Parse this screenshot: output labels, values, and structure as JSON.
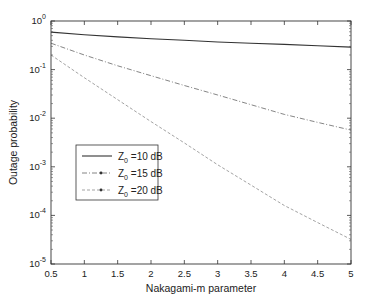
{
  "chart_data": {
    "type": "line",
    "title": "",
    "xlabel": "Nakagami-m parameter",
    "ylabel": "Outage probability",
    "xlim": [
      0.5,
      5
    ],
    "ylim_log10": [
      -5,
      0
    ],
    "yscale": "log",
    "grid": false,
    "legend_position": "left-center",
    "x_ticks": [
      "0.5",
      "1",
      "1.5",
      "2",
      "2.5",
      "3",
      "3.5",
      "4",
      "4.5",
      "5"
    ],
    "y_ticks": [
      {
        "base": "10",
        "exp": "0"
      },
      {
        "base": "10",
        "exp": "-1"
      },
      {
        "base": "10",
        "exp": "-2"
      },
      {
        "base": "10",
        "exp": "-3"
      },
      {
        "base": "10",
        "exp": "-4"
      },
      {
        "base": "10",
        "exp": "-5"
      }
    ],
    "x": [
      0.5,
      1,
      1.5,
      2,
      2.5,
      3,
      3.5,
      4,
      4.5,
      5
    ],
    "series": [
      {
        "name": "Z0 =10 dB",
        "label_main": "Z",
        "label_sub": "0",
        "label_rest": " =10 dB",
        "style": "solid",
        "color": "#333333",
        "values": [
          0.59,
          0.52,
          0.47,
          0.43,
          0.4,
          0.37,
          0.35,
          0.33,
          0.31,
          0.29
        ]
      },
      {
        "name": "Z0 =15 dB",
        "label_main": "Z",
        "label_sub": "0",
        "label_rest": " =15 dB",
        "style": "dash-dot-marker",
        "color": "#777777",
        "values": [
          0.35,
          0.2,
          0.12,
          0.075,
          0.047,
          0.03,
          0.019,
          0.012,
          0.0082,
          0.0057
        ]
      },
      {
        "name": "Z0 =20 dB",
        "label_main": "Z",
        "label_sub": "0",
        "label_rest": " =20 dB",
        "style": "dashed-marker",
        "color": "#999999",
        "values": [
          0.2,
          0.068,
          0.024,
          0.0085,
          0.0031,
          0.0011,
          0.00042,
          0.00016,
          7.1e-05,
          3.2e-05
        ]
      }
    ]
  }
}
